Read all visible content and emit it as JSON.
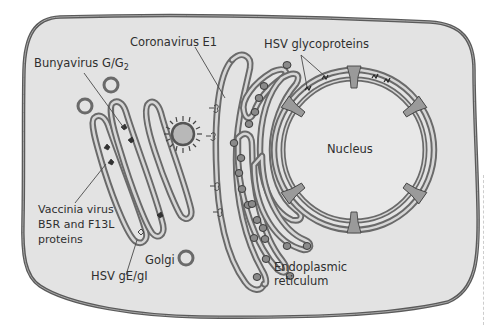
{
  "figure": {
    "type": "cell-diagram",
    "colors": {
      "cytoplasm": "#e3e3e3",
      "membrane": "#6a6a6a",
      "nucleoplasm": "#e8e8e8",
      "background": "#ffffff",
      "text": "#2f2f2f"
    }
  },
  "labels": {
    "bunyavirus": "Bunyavirus G/G",
    "bunyavirus_sub": "2",
    "coronavirus": "Coronavirus E1",
    "hsv_glycoproteins": "HSV glycoproteins",
    "nucleus": "Nucleus",
    "vaccinia_line1": "Vaccinia virus",
    "vaccinia_line2": "B5R and F13L",
    "vaccinia_line3": "proteins",
    "hsv_ge_gi": "HSV gE/gI",
    "golgi": "Golgi",
    "er_line1": "Endoplasmic",
    "er_line2": "reticulum"
  },
  "organelles": [
    "Cell membrane",
    "Golgi apparatus",
    "Golgi vesicles",
    "Virion particle",
    "Endoplasmic reticulum",
    "Ribosomes",
    "Nucleus",
    "Nuclear pores"
  ]
}
